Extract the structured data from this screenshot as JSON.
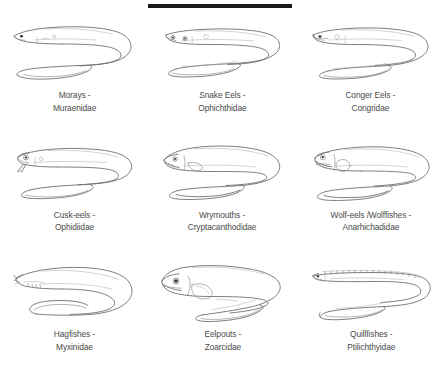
{
  "figure": {
    "divider": {
      "name": "top-horizontal-rule",
      "color": "#1a1a1a"
    },
    "background_color": "#ffffff",
    "line_color": "#6f6f6f",
    "label_color": "#4a4a4a"
  },
  "items": [
    {
      "id": "morays",
      "common_name": "Morays -",
      "family_name": "Muraenidae",
      "icon": "moray-eel-illustration"
    },
    {
      "id": "snake-eels",
      "common_name": "Snake Eels -",
      "family_name": "Ophichthidae",
      "icon": "snake-eel-illustration"
    },
    {
      "id": "conger-eels",
      "common_name": "Conger Eels -",
      "family_name": "Congridae",
      "icon": "conger-eel-illustration"
    },
    {
      "id": "cusk-eels",
      "common_name": "Cusk-eels -",
      "family_name": "Ophidiidae",
      "icon": "cusk-eel-illustration"
    },
    {
      "id": "wrymouths",
      "common_name": "Wrymouths -",
      "family_name": "Cryptacanthodidae",
      "icon": "wrymouth-illustration"
    },
    {
      "id": "wolf-eels",
      "common_name": "Wolf-eels /Wolffishes -",
      "family_name": "Anarhichadidae",
      "icon": "wolf-eel-illustration"
    },
    {
      "id": "hagfishes",
      "common_name": "Hagfishes -",
      "family_name": "Myxinidae",
      "icon": "hagfish-illustration"
    },
    {
      "id": "eelpouts",
      "common_name": "Eelpouts -",
      "family_name": "Zoarcidae",
      "icon": "eelpout-illustration"
    },
    {
      "id": "quillfishes",
      "common_name": "Quillfishes -",
      "family_name": "Ptilichthyidae",
      "icon": "quillfish-illustration"
    }
  ]
}
